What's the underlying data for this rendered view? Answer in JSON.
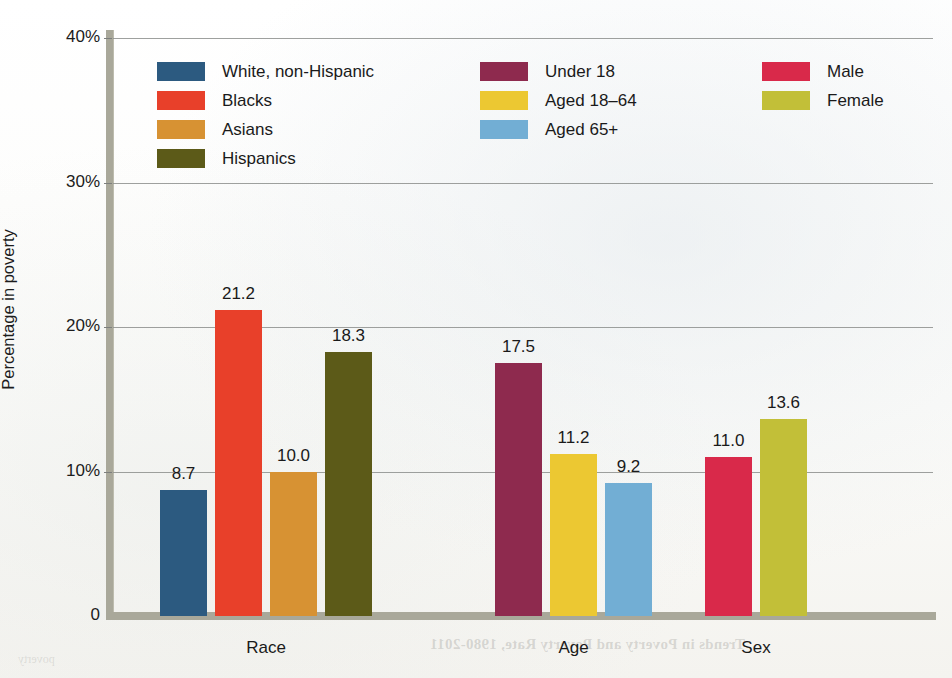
{
  "chart_data": {
    "type": "bar",
    "title": "",
    "xlabel": "",
    "ylabel": "Percentage in poverty",
    "ylim": [
      0,
      40
    ],
    "grid": true,
    "legend_position": "inside-top-left",
    "y_ticks": [
      {
        "value": 0,
        "label": "0"
      },
      {
        "value": 10,
        "label": "10%"
      },
      {
        "value": 20,
        "label": "20%"
      },
      {
        "value": 30,
        "label": "30%"
      },
      {
        "value": 40,
        "label": "40%"
      }
    ],
    "groups": [
      {
        "name": "Race",
        "bars": [
          {
            "label": "White, non-Hispanic",
            "value": 8.7,
            "value_label": "8.7",
            "color": "#2c5a80"
          },
          {
            "label": "Blacks",
            "value": 21.2,
            "value_label": "21.2",
            "color": "#e8402a"
          },
          {
            "label": "Asians",
            "value": 10.0,
            "value_label": "10.0",
            "color": "#d79233"
          },
          {
            "label": "Hispanics",
            "value": 18.3,
            "value_label": "18.3",
            "color": "#5c5a18"
          }
        ]
      },
      {
        "name": "Age",
        "bars": [
          {
            "label": "Under 18",
            "value": 17.5,
            "value_label": "17.5",
            "color": "#8e2a4e"
          },
          {
            "label": "Aged 18–64",
            "value": 11.2,
            "value_label": "11.2",
            "color": "#ecc832"
          },
          {
            "label": "Aged 65+",
            "value": 9.2,
            "value_label": "9.2",
            "color": "#72aed4"
          }
        ]
      },
      {
        "name": "Sex",
        "bars": [
          {
            "label": "Male",
            "value": 11.0,
            "value_label": "11.0",
            "color": "#d9294a"
          },
          {
            "label": "Female",
            "value": 13.6,
            "value_label": "13.6",
            "color": "#c2bf38"
          }
        ]
      }
    ],
    "legend": [
      {
        "label": "White, non-Hispanic",
        "color": "#2c5a80"
      },
      {
        "label": "Blacks",
        "color": "#e8402a"
      },
      {
        "label": "Asians",
        "color": "#d79233"
      },
      {
        "label": "Hispanics",
        "color": "#5c5a18"
      },
      {
        "label": "Under 18",
        "color": "#8e2a4e"
      },
      {
        "label": "Aged 18–64",
        "color": "#ecc832"
      },
      {
        "label": "Aged 65+",
        "color": "#72aed4"
      },
      {
        "label": "Male",
        "color": "#d9294a"
      },
      {
        "label": "Female",
        "color": "#c2bf38"
      }
    ]
  },
  "bleed_through": {
    "line1": "Trends in Poverty and Poverty Rate, 1980-2011",
    "line2": "poverty"
  }
}
